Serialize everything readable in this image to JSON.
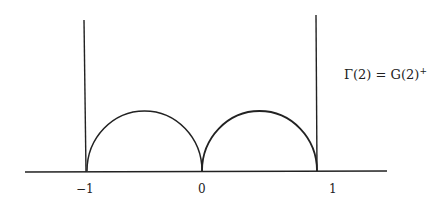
{
  "figure": {
    "label_main": "Γ(2) = G(2)",
    "label_sup": "+",
    "ticks": [
      {
        "label": "−1",
        "x": -1
      },
      {
        "label": "0",
        "x": 0
      },
      {
        "label": "1",
        "x": 1
      }
    ],
    "elements": [
      "real axis",
      "vertical line at x = -1",
      "vertical line at x = 1",
      "semicircle from -1 to 0",
      "semicircle from 0 to 1"
    ],
    "colors": {
      "stroke": "#222222",
      "background": "#ffffff"
    }
  }
}
